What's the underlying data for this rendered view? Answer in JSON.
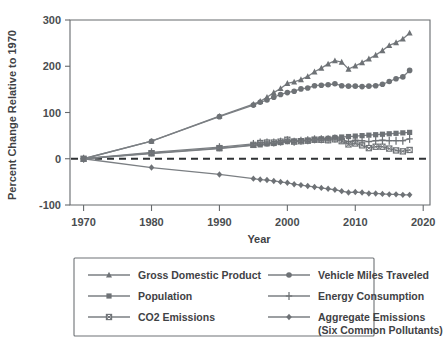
{
  "chart_data": {
    "type": "line",
    "title": "",
    "xlabel": "Year",
    "ylabel": "Percent Change Relative to 1970",
    "xlim": [
      1968,
      2021
    ],
    "ylim": [
      -100,
      300
    ],
    "xticks": [
      1970,
      1980,
      1990,
      2000,
      2010,
      2020
    ],
    "xticklabels": [
      "1970",
      "1980",
      "1990",
      "2000",
      "2010",
      "2020"
    ],
    "yticks": [
      -100,
      0,
      100,
      200,
      300
    ],
    "yticklabels": [
      "-100",
      "0",
      "100",
      "200",
      "300"
    ],
    "grid": false,
    "legend_position": "below",
    "zero_reference_line": 0,
    "series": [
      {
        "name": "Gross Domestic Product",
        "marker": "triangle",
        "x": [
          1970,
          1980,
          1990,
          1995,
          1996,
          1997,
          1998,
          1999,
          2000,
          2001,
          2002,
          2003,
          2004,
          2005,
          2006,
          2007,
          2008,
          2009,
          2010,
          2011,
          2012,
          2013,
          2014,
          2015,
          2016,
          2017,
          2018
        ],
        "values": [
          0,
          38,
          92,
          118,
          124,
          133,
          143,
          152,
          163,
          166,
          171,
          178,
          188,
          196,
          205,
          212,
          209,
          194,
          201,
          208,
          216,
          224,
          234,
          245,
          251,
          259,
          272
        ]
      },
      {
        "name": "Vehicle Miles Traveled",
        "marker": "circle",
        "x": [
          1970,
          1980,
          1990,
          1995,
          1996,
          1997,
          1998,
          1999,
          2000,
          2001,
          2002,
          2003,
          2004,
          2005,
          2006,
          2007,
          2008,
          2009,
          2010,
          2011,
          2012,
          2013,
          2014,
          2015,
          2016,
          2017,
          2018
        ],
        "values": [
          0,
          38,
          91,
          116,
          122,
          127,
          133,
          139,
          143,
          146,
          151,
          153,
          158,
          159,
          160,
          162,
          158,
          157,
          157,
          156,
          157,
          158,
          161,
          167,
          173,
          177,
          191
        ]
      },
      {
        "name": "Population",
        "marker": "square",
        "x": [
          1970,
          1980,
          1990,
          1995,
          1996,
          1997,
          1998,
          1999,
          2000,
          2001,
          2002,
          2003,
          2004,
          2005,
          2006,
          2007,
          2008,
          2009,
          2010,
          2011,
          2012,
          2013,
          2014,
          2015,
          2016,
          2017,
          2018
        ],
        "values": [
          0,
          11,
          22,
          29,
          30,
          32,
          33,
          35,
          37,
          38,
          39,
          40,
          42,
          43,
          44,
          46,
          47,
          48,
          49,
          50,
          51,
          52,
          53,
          54,
          55,
          56,
          57
        ]
      },
      {
        "name": "Energy Consumption",
        "marker": "plus",
        "x": [
          1970,
          1980,
          1990,
          1995,
          1996,
          1997,
          1998,
          1999,
          2000,
          2001,
          2002,
          2003,
          2004,
          2005,
          2006,
          2007,
          2008,
          2009,
          2010,
          2011,
          2012,
          2013,
          2014,
          2015,
          2016,
          2017,
          2018
        ],
        "values": [
          0,
          14,
          25,
          32,
          35,
          35,
          35,
          37,
          40,
          37,
          39,
          40,
          42,
          42,
          42,
          44,
          42,
          37,
          40,
          39,
          37,
          39,
          40,
          39,
          39,
          39,
          43
        ]
      },
      {
        "name": "CO2 Emissions",
        "marker": "cross-square",
        "x": [
          1970,
          1980,
          1990,
          1995,
          1996,
          1997,
          1998,
          1999,
          2000,
          2001,
          2002,
          2003,
          2004,
          2005,
          2006,
          2007,
          2008,
          2009,
          2010,
          2011,
          2012,
          2013,
          2014,
          2015,
          2016,
          2017,
          2018
        ],
        "values": [
          0,
          12,
          23,
          30,
          34,
          35,
          35,
          37,
          41,
          37,
          38,
          39,
          41,
          41,
          40,
          42,
          38,
          31,
          33,
          29,
          23,
          26,
          26,
          22,
          18,
          16,
          19
        ]
      },
      {
        "name": "Aggregate Emissions (Six Common Pollutants)",
        "marker": "diamond",
        "x": [
          1970,
          1980,
          1990,
          1995,
          1996,
          1997,
          1998,
          1999,
          2000,
          2001,
          2002,
          2003,
          2004,
          2005,
          2006,
          2007,
          2008,
          2009,
          2010,
          2011,
          2012,
          2013,
          2014,
          2015,
          2016,
          2017,
          2018
        ],
        "values": [
          0,
          -19,
          -34,
          -43,
          -45,
          -46,
          -48,
          -50,
          -52,
          -55,
          -57,
          -59,
          -61,
          -63,
          -65,
          -67,
          -70,
          -73,
          -72,
          -73,
          -75,
          -75,
          -76,
          -77,
          -77,
          -78,
          -78
        ]
      }
    ]
  },
  "legend": {
    "entries": [
      {
        "label": "Gross Domestic Product",
        "marker": "triangle"
      },
      {
        "label": "Vehicle Miles Traveled",
        "marker": "circle"
      },
      {
        "label": "Population",
        "marker": "square"
      },
      {
        "label": "Energy Consumption",
        "marker": "plus"
      },
      {
        "label": "CO2 Emissions",
        "marker": "cross-square"
      },
      {
        "label": "Aggregate Emissions",
        "label2": "(Six Common Pollutants)",
        "marker": "diamond"
      }
    ]
  },
  "colors": {
    "line": "#7b7f83",
    "marker": "#6e7276",
    "axis": "#666a6d",
    "text": "#3f4245",
    "zero_line": "#2f3234",
    "background": "#ffffff"
  }
}
